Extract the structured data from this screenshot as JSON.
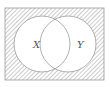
{
  "diagram": {
    "type": "venn",
    "universe": {
      "x": 5,
      "y": 8,
      "width": 99,
      "height": 72
    },
    "shaded_region": "complement of X union Y",
    "sets": [
      {
        "label": "X",
        "cx": 42,
        "cy": 44,
        "r": 28,
        "label_x": 33,
        "label_y": 48
      },
      {
        "label": "Y",
        "cx": 68,
        "cy": 44,
        "r": 28,
        "label_x": 77,
        "label_y": 48
      }
    ],
    "colors": {
      "stroke": "#9a9a9a",
      "hatch": "#a8a8a8",
      "fill": "#ffffff"
    }
  }
}
